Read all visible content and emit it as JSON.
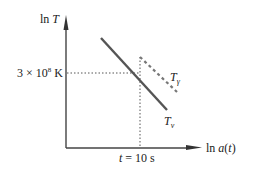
{
  "diagram": {
    "type": "log-log temperature vs scale factor sketch",
    "y_axis": {
      "label_prefix": "ln ",
      "label_var": "T"
    },
    "x_axis": {
      "label_prefix": "ln ",
      "label_var": "a",
      "label_suffix_open": "(",
      "label_suffix_var": "t",
      "label_suffix_close": ")"
    },
    "reference": {
      "temperature_coeff": "3 × 10",
      "temperature_exp": "8",
      "temperature_unit": " K",
      "time_var": "t",
      "time_value": " = 10 s"
    },
    "curves": [
      {
        "name": "neutrino-temperature",
        "label_main": "T",
        "label_sub": "ν",
        "style": "solid",
        "color": "#555555"
      },
      {
        "name": "photon-temperature",
        "label_main": "T",
        "label_sub": "γ",
        "style": "dashed",
        "color": "#777777"
      }
    ],
    "colors": {
      "axis": "#444444",
      "guide": "#555555",
      "text": "#222222"
    }
  }
}
